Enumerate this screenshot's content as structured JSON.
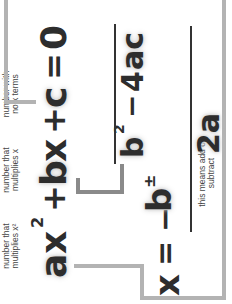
{
  "equation_top": {
    "a": "a",
    "x": "x",
    "sq": "2",
    "plus1": "+",
    "b": "b",
    "x2": "x",
    "plus2": "+",
    "c": "c",
    "eq": "=",
    "zero": "0"
  },
  "formula": {
    "x": "x",
    "eq": "=",
    "minus": "−",
    "b": "b",
    "pm": "±",
    "b2": "b",
    "sq": "2",
    "minus2": "−",
    "four": "4",
    "ac": "ac",
    "denominator": "2a"
  },
  "annotations": {
    "a_note": "number that multiplies x²",
    "b_note": "number that multiplies x",
    "c_note": "number with no x terms",
    "pm_note": "this means add or subtract"
  },
  "colors": {
    "text": "#2d2d2d",
    "connector": "#b3b3b3",
    "connector_dark": "#8a8a8a"
  }
}
